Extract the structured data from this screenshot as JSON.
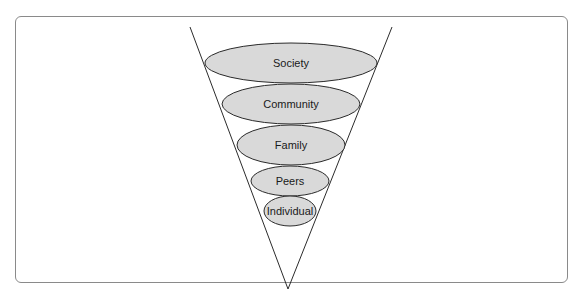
{
  "diagram": {
    "type": "inverted-cone-layers",
    "colors": {
      "ellipse_fill": "#d9d9d9",
      "stroke": "#2b2b2b",
      "frame": "#8a8a8a"
    },
    "layers": [
      {
        "label": "Society"
      },
      {
        "label": "Community"
      },
      {
        "label": "Family"
      },
      {
        "label": "Peers"
      },
      {
        "label": "Individual"
      }
    ]
  }
}
